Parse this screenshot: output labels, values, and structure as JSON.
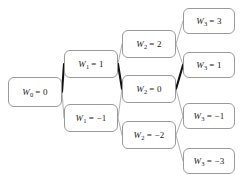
{
  "diagram": {
    "type": "binomial-lattice",
    "variable_symbol": "W",
    "background_color": "#ffffff",
    "node_border_color": "#9a9a9a",
    "edge_color": "#8c8c8c",
    "highlight_color": "#111111",
    "columns": [
      {
        "step": 0,
        "nodes": [
          {
            "id": "n0",
            "subscript": "0",
            "value": "0",
            "label": "W0 = 0",
            "x": 8,
            "y": 77,
            "w": 54,
            "h": 30
          }
        ]
      },
      {
        "step": 1,
        "nodes": [
          {
            "id": "n1u",
            "subscript": "1",
            "value": "1",
            "label": "W1 = 1",
            "x": 64,
            "y": 50,
            "w": 54,
            "h": 28
          },
          {
            "id": "n1d",
            "subscript": "1",
            "value": "-1",
            "label": "W1 = -1",
            "x": 64,
            "y": 104,
            "w": 54,
            "h": 28
          }
        ]
      },
      {
        "step": 2,
        "nodes": [
          {
            "id": "n2u",
            "subscript": "2",
            "value": "2",
            "label": "W2 = 2",
            "x": 122,
            "y": 30,
            "w": 54,
            "h": 28
          },
          {
            "id": "n2m",
            "subscript": "2",
            "value": "0",
            "label": "W2 = 0",
            "x": 122,
            "y": 75,
            "w": 54,
            "h": 28
          },
          {
            "id": "n2d",
            "subscript": "2",
            "value": "-2",
            "label": "W2 = -2",
            "x": 122,
            "y": 121,
            "w": 54,
            "h": 28
          }
        ]
      },
      {
        "step": 3,
        "nodes": [
          {
            "id": "n3a",
            "subscript": "3",
            "value": "3",
            "label": "W3 = 3",
            "x": 183,
            "y": 8,
            "w": 52,
            "h": 26
          },
          {
            "id": "n3b",
            "subscript": "3",
            "value": "1",
            "label": "W3 = 1",
            "x": 183,
            "y": 52,
            "w": 52,
            "h": 26
          },
          {
            "id": "n3c",
            "subscript": "3",
            "value": "-1",
            "label": "W3 = -1",
            "x": 183,
            "y": 103,
            "w": 52,
            "h": 26
          },
          {
            "id": "n3d",
            "subscript": "3",
            "value": "-3",
            "label": "W3 = -3",
            "x": 183,
            "y": 148,
            "w": 52,
            "h": 26
          }
        ]
      }
    ],
    "edges": [
      {
        "from": "n0",
        "to": "n1u",
        "highlighted": true
      },
      {
        "from": "n0",
        "to": "n1d",
        "highlighted": false
      },
      {
        "from": "n1u",
        "to": "n2u",
        "highlighted": false
      },
      {
        "from": "n1u",
        "to": "n2m",
        "highlighted": true
      },
      {
        "from": "n1d",
        "to": "n2m",
        "highlighted": false
      },
      {
        "from": "n1d",
        "to": "n2d",
        "highlighted": false
      },
      {
        "from": "n2u",
        "to": "n3a",
        "highlighted": false
      },
      {
        "from": "n2u",
        "to": "n3b",
        "highlighted": false
      },
      {
        "from": "n2m",
        "to": "n3b",
        "highlighted": true
      },
      {
        "from": "n2m",
        "to": "n3c",
        "highlighted": false
      },
      {
        "from": "n2d",
        "to": "n3c",
        "highlighted": false
      },
      {
        "from": "n2d",
        "to": "n3d",
        "highlighted": false
      }
    ],
    "highlighted_path": [
      "n0",
      "n1u",
      "n2m",
      "n3b"
    ]
  }
}
